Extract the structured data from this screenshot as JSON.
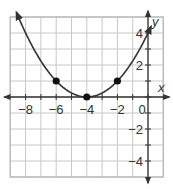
{
  "chart_data": {
    "type": "line",
    "title": "",
    "xlabel": "x",
    "ylabel": "y",
    "xlim": [
      -9,
      1
    ],
    "ylim": [
      -5,
      5
    ],
    "grid": true,
    "x_tick_labels": [
      {
        "value": -8,
        "label": "−8"
      },
      {
        "value": -6,
        "label": "−6"
      },
      {
        "value": -4,
        "label": "−4"
      },
      {
        "value": -2,
        "label": "−2"
      }
    ],
    "y_tick_labels": [
      {
        "value": 4,
        "label": "4"
      },
      {
        "value": 2,
        "label": "2"
      },
      {
        "value": -2,
        "label": "−2"
      },
      {
        "value": -4,
        "label": "−4"
      }
    ],
    "origin_label": "0",
    "series": [
      {
        "name": "parabola",
        "equation": "y = 0.25(x + 4)^2",
        "curve_x_range": [
          -8.6,
          0.2
        ],
        "points": [
          {
            "x": -6,
            "y": 1
          },
          {
            "x": -4,
            "y": 0
          },
          {
            "x": -2,
            "y": 1
          }
        ]
      }
    ],
    "colors": {
      "grid": "#c8c8c8",
      "axis": "#333333",
      "curve": "#333333",
      "point": "#111111",
      "frame": "#bdbdbd"
    }
  }
}
